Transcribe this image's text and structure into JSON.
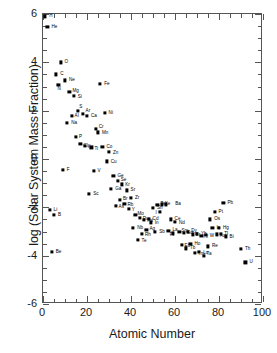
{
  "chart_data": {
    "type": "scatter",
    "title": "",
    "xlabel": "Atomic Number",
    "ylabel": "log (Solar System Mass Fraction)",
    "xlim": [
      0,
      100
    ],
    "ylim": [
      -6,
      6
    ],
    "xticks": [
      0,
      20,
      40,
      60,
      80,
      100
    ],
    "yticks": [
      -6,
      -4,
      -2,
      0,
      2,
      4,
      6
    ],
    "xtick_labels": [
      "0",
      "20",
      "40",
      "60",
      "80",
      "100"
    ],
    "ytick_labels": [
      "-6",
      "-4",
      "-2",
      "0",
      "2",
      "4",
      "6"
    ],
    "x_minor_tick_interval": 5,
    "y_minor_tick_interval": 0.5,
    "grid": false,
    "legend": null,
    "marker": "filled-square",
    "marker_color": "#000000",
    "points": [
      {
        "label": "H",
        "x": 1,
        "y": 5.9,
        "lx": 4,
        "ly": 0
      },
      {
        "label": "He",
        "x": 2,
        "y": 5.45,
        "lx": 4,
        "ly": 0
      },
      {
        "label": "O",
        "x": 8,
        "y": 4.0,
        "lx": 4,
        "ly": 0
      },
      {
        "label": "C",
        "x": 6,
        "y": 3.5,
        "lx": 4,
        "ly": 0
      },
      {
        "label": "N",
        "x": 7,
        "y": 3.05,
        "lx": -1,
        "ly": 3.4
      },
      {
        "label": "Ne",
        "x": 10,
        "y": 3.25,
        "lx": 4,
        "ly": 0
      },
      {
        "label": "Mg",
        "x": 12,
        "y": 2.78,
        "lx": 3,
        "ly": -0.6
      },
      {
        "label": "Si",
        "x": 14,
        "y": 2.62,
        "lx": 4,
        "ly": 0.9
      },
      {
        "label": "Fe",
        "x": 26,
        "y": 3.1,
        "lx": 4,
        "ly": 0
      },
      {
        "label": "S",
        "x": 16,
        "y": 2.0,
        "lx": 1,
        "ly": -3.4
      },
      {
        "label": "Ar",
        "x": 18,
        "y": 1.85,
        "lx": 3,
        "ly": -2.8
      },
      {
        "label": "Al",
        "x": 13,
        "y": 1.78,
        "lx": 3,
        "ly": 0
      },
      {
        "label": "Ca",
        "x": 20,
        "y": 1.78,
        "lx": 4,
        "ly": 0
      },
      {
        "label": "Ni",
        "x": 28,
        "y": 1.9,
        "lx": 4,
        "ly": 0
      },
      {
        "label": "Na",
        "x": 11,
        "y": 1.5,
        "lx": 4,
        "ly": 0
      },
      {
        "label": "Cr",
        "x": 24,
        "y": 1.25,
        "lx": 3,
        "ly": -1.6
      },
      {
        "label": "Mn",
        "x": 25,
        "y": 1.1,
        "lx": 4,
        "ly": 0.7
      },
      {
        "label": "P",
        "x": 15,
        "y": 0.9,
        "lx": 3,
        "ly": 0
      },
      {
        "label": "Cl",
        "x": 17,
        "y": 0.62,
        "lx": 3,
        "ly": 1.8
      },
      {
        "label": "K",
        "x": 19,
        "y": 0.55,
        "lx": 3,
        "ly": 1.4
      },
      {
        "label": "Ti",
        "x": 22,
        "y": 0.48,
        "lx": 3,
        "ly": 1.4
      },
      {
        "label": "Co",
        "x": 27,
        "y": 0.5,
        "lx": 4,
        "ly": 0
      },
      {
        "label": "Zn",
        "x": 30,
        "y": 0.3,
        "lx": 4,
        "ly": 0.8
      },
      {
        "label": "Cu",
        "x": 29,
        "y": -0.1,
        "lx": 4,
        "ly": 0.8
      },
      {
        "label": "F",
        "x": 9,
        "y": -0.45,
        "lx": 4,
        "ly": 0
      },
      {
        "label": "V",
        "x": 23,
        "y": -0.5,
        "lx": 4,
        "ly": 0
      },
      {
        "label": "Ge",
        "x": 32,
        "y": -0.7,
        "lx": 4,
        "ly": 0
      },
      {
        "label": "Se",
        "x": 34,
        "y": -0.92,
        "lx": 3,
        "ly": -1.4
      },
      {
        "label": "Kr",
        "x": 36,
        "y": -1.05,
        "lx": 3,
        "ly": 1.0
      },
      {
        "label": "Ga",
        "x": 31,
        "y": -1.25,
        "lx": 4,
        "ly": 0
      },
      {
        "label": "Sr",
        "x": 38,
        "y": -1.3,
        "lx": 4,
        "ly": 0
      },
      {
        "label": "Sc",
        "x": 21,
        "y": -1.45,
        "lx": 4,
        "ly": 0
      },
      {
        "label": "Br",
        "x": 35,
        "y": -1.68,
        "lx": 3,
        "ly": -1.1
      },
      {
        "label": "Zr",
        "x": 40,
        "y": -1.62,
        "lx": 4,
        "ly": 0
      },
      {
        "label": "Rb",
        "x": 37,
        "y": -1.85,
        "lx": 3,
        "ly": 0.8
      },
      {
        "label": "As",
        "x": 33,
        "y": -1.95,
        "lx": 3,
        "ly": 0.6
      },
      {
        "label": "Y",
        "x": 39,
        "y": -2.08,
        "lx": 3,
        "ly": 1.0
      },
      {
        "label": "Te",
        "x": 52,
        "y": -1.9,
        "lx": 3,
        "ly": -1.4
      },
      {
        "label": "Xe",
        "x": 54,
        "y": -1.88,
        "lx": 3,
        "ly": 0
      },
      {
        "label": "Ba",
        "x": 56,
        "y": -1.88,
        "lx": 9,
        "ly": 0
      },
      {
        "label": "Sn",
        "x": 50,
        "y": -2.02,
        "lx": 4,
        "ly": 0
      },
      {
        "label": "I",
        "x": 53,
        "y": -2.18,
        "lx": -4,
        "ly": 1.4
      },
      {
        "label": "Pb",
        "x": 82,
        "y": -1.8,
        "lx": 4,
        "ly": 0
      },
      {
        "label": "Li",
        "x": 3,
        "y": -2.1,
        "lx": 4,
        "ly": 0
      },
      {
        "label": "B",
        "x": 5,
        "y": -2.3,
        "lx": 4,
        "ly": 0
      },
      {
        "label": "Pt",
        "x": 78,
        "y": -2.2,
        "lx": 4,
        "ly": 0
      },
      {
        "label": "Mo",
        "x": 42,
        "y": -2.32,
        "lx": 2,
        "ly": -1.4
      },
      {
        "label": "Ru",
        "x": 44,
        "y": -2.45,
        "lx": 3,
        "ly": 0.7
      },
      {
        "label": "Pd",
        "x": 46,
        "y": -2.52,
        "lx": 3,
        "ly": 1.2
      },
      {
        "label": "Cd",
        "x": 48,
        "y": -2.48,
        "lx": 4,
        "ly": 0
      },
      {
        "label": "In",
        "x": 49,
        "y": -2.62,
        "lx": 4,
        "ly": 0.5
      },
      {
        "label": "Ce",
        "x": 58,
        "y": -2.5,
        "lx": 4,
        "ly": -0.8
      },
      {
        "label": "Nd",
        "x": 60,
        "y": -2.6,
        "lx": 4,
        "ly": 0.7
      },
      {
        "label": "Os",
        "x": 76,
        "y": -2.5,
        "lx": 4,
        "ly": 0
      },
      {
        "label": "Nb",
        "x": 41,
        "y": -2.85,
        "lx": 4,
        "ly": 0
      },
      {
        "label": "Ag",
        "x": 47,
        "y": -2.95,
        "lx": 3,
        "ly": -1.2
      },
      {
        "label": "Sb",
        "x": 51,
        "y": -3.0,
        "lx": 4,
        "ly": 0.5
      },
      {
        "label": "Rh",
        "x": 45,
        "y": -3.1,
        "lx": 3,
        "ly": 1.2
      },
      {
        "label": "La",
        "x": 57,
        "y": -2.98,
        "lx": 4,
        "ly": -0.8
      },
      {
        "label": "Pr",
        "x": 59,
        "y": -3.08,
        "lx": -3,
        "ly": 1.2
      },
      {
        "label": "Sm",
        "x": 62,
        "y": -3.02,
        "lx": 2,
        "ly": -1.2
      },
      {
        "label": "Gd",
        "x": 64,
        "y": -3.05,
        "lx": 3,
        "ly": 0.6
      },
      {
        "label": "Dy",
        "x": 66,
        "y": -3.02,
        "lx": 3,
        "ly": -1.2
      },
      {
        "label": "Er",
        "x": 68,
        "y": -3.12,
        "lx": 3,
        "ly": 0.6
      },
      {
        "label": "Yb",
        "x": 70,
        "y": -3.1,
        "lx": 4,
        "ly": 0.5
      },
      {
        "label": "Hf",
        "x": 72,
        "y": -3.18,
        "lx": 2,
        "ly": 0.8
      },
      {
        "label": "W",
        "x": 74,
        "y": -3.15,
        "lx": 4,
        "ly": 0.9
      },
      {
        "label": "Ir",
        "x": 77,
        "y": -2.85,
        "lx": 4,
        "ly": 0
      },
      {
        "label": "Hg",
        "x": 80,
        "y": -2.85,
        "lx": 4,
        "ly": 0
      },
      {
        "label": "Au",
        "x": 79,
        "y": -3.12,
        "lx": 3,
        "ly": 1.1
      },
      {
        "label": "Tl",
        "x": 81,
        "y": -3.1,
        "lx": 3,
        "ly": 0.4
      },
      {
        "label": "Bi",
        "x": 83,
        "y": -3.2,
        "lx": 4,
        "ly": 0.6
      },
      {
        "label": "Te2",
        "x": 43,
        "y": -3.35,
        "lx": 4,
        "ly": 0.6
      },
      {
        "label": "Eu",
        "x": 63,
        "y": -3.55,
        "lx": 3,
        "ly": 0.8
      },
      {
        "label": "Ho",
        "x": 67,
        "y": -3.5,
        "lx": 4,
        "ly": 0
      },
      {
        "label": "Tb",
        "x": 65,
        "y": -3.7,
        "lx": 4,
        "ly": 0
      },
      {
        "label": "Tm",
        "x": 69,
        "y": -3.88,
        "lx": 3,
        "ly": 0.8
      },
      {
        "label": "Lu",
        "x": 71,
        "y": -3.85,
        "lx": 4,
        "ly": 0.6
      },
      {
        "label": "Re",
        "x": 75,
        "y": -3.62,
        "lx": 4,
        "ly": 0
      },
      {
        "label": "Ta",
        "x": 73,
        "y": -4.0,
        "lx": 3,
        "ly": -1.4
      },
      {
        "label": "Be",
        "x": 4,
        "y": -3.85,
        "lx": 4,
        "ly": 0
      },
      {
        "label": "Th",
        "x": 90,
        "y": -3.72,
        "lx": 4,
        "ly": 0
      },
      {
        "label": "U",
        "x": 92,
        "y": -4.28,
        "lx": 4,
        "ly": 0
      }
    ]
  }
}
